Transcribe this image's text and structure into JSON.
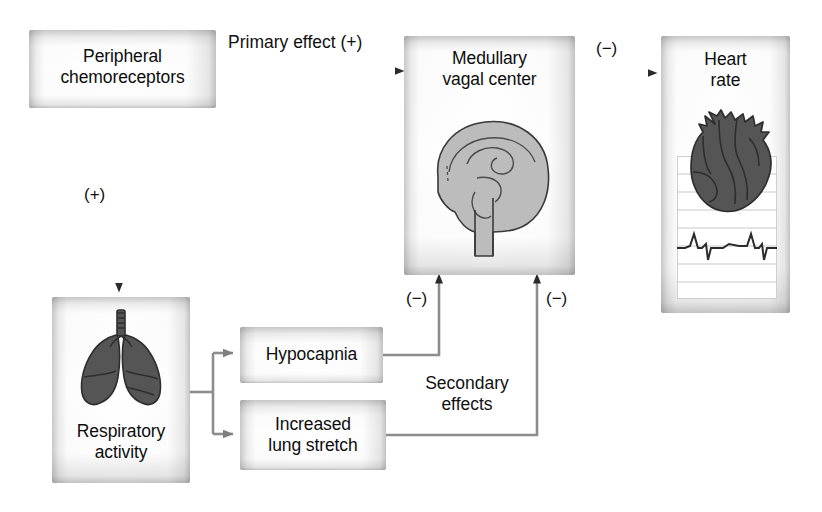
{
  "diagram": {
    "colors": {
      "box_edge": "#c4c4c4",
      "box_fill": "#ffffff",
      "dark_arrow": "#2b2b2b",
      "gray_arrow": "#8a8a8a",
      "brain_fill": "#b9b9b9",
      "organ_dark": "#555555",
      "outline": "#2e2e2e",
      "ecg_rule": "#b9b9b9",
      "text": "#111111"
    }
  },
  "nodes": {
    "peripheral_chemoreceptors": {
      "label": "Peripheral\nchemoreceptors",
      "art": "none"
    },
    "medullary_vagal_center": {
      "label": "Medullary\nvagal center",
      "art": "brain-sagittal-illustration"
    },
    "heart_rate": {
      "label": "Heart\nrate",
      "art": "heart-with-ecg-illustration"
    },
    "respiratory_activity": {
      "label": "Respiratory\nactivity",
      "art": "lungs-illustration"
    },
    "hypocapnia": {
      "label": "Hypocapnia",
      "art": "none"
    },
    "increased_lung_stretch": {
      "label": "Increased\nlung stretch",
      "art": "none"
    }
  },
  "edges": {
    "chemo_to_medulla": {
      "label": "Primary effect (+)",
      "sign": "(+)"
    },
    "chemo_to_respiratory": {
      "label": "(+)",
      "sign": "(+)"
    },
    "medulla_to_heart": {
      "label": "(−)",
      "sign": "(−)"
    },
    "hypocapnia_to_medulla": {
      "label": "(−)",
      "sign": "(−)"
    },
    "lung_stretch_to_medulla": {
      "label": "(−)",
      "sign": "(−)"
    },
    "secondary_effects": {
      "label": "Secondary\neffects"
    }
  },
  "icons": {
    "brain": "brain-icon",
    "heart": "heart-icon",
    "lungs": "lungs-icon",
    "ecg": "ecg-waveform-icon"
  }
}
